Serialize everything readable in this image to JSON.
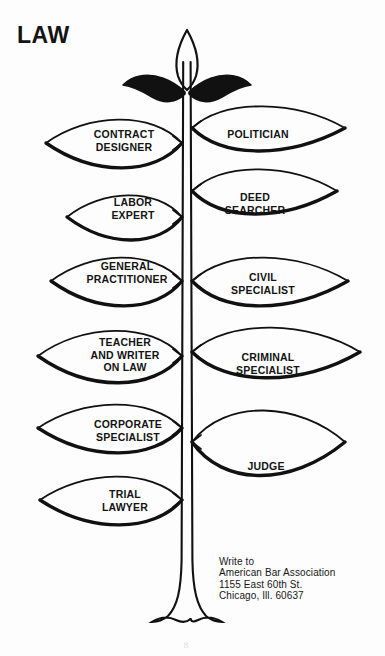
{
  "title": "LAW",
  "stem": {
    "icon": "plant-stem",
    "sprout_icon": "sprout-top-icon"
  },
  "leaves": [
    {
      "id": "contract-designer",
      "label": "CONTRACT\nDESIGNER",
      "side": "left",
      "attach_y": 143,
      "tip_x": 46,
      "text_x": 124,
      "text_y": 140,
      "half_h": 26,
      "bulge": 0.52
    },
    {
      "id": "politician",
      "label": "POLITICIAN",
      "side": "right",
      "attach_y": 128,
      "tip_x": 345,
      "text_x": 258,
      "text_y": 134,
      "half_h": 24,
      "bulge": 0.5
    },
    {
      "id": "deed-searcher",
      "label": "DEED\nSEARCHER",
      "side": "right",
      "attach_y": 191,
      "tip_x": 337,
      "text_x": 255,
      "text_y": 203,
      "half_h": 24,
      "bulge": 0.5
    },
    {
      "id": "labor-expert",
      "label": "LABOR\nEXPERT",
      "side": "left",
      "attach_y": 217,
      "tip_x": 67,
      "text_x": 133,
      "text_y": 208,
      "half_h": 24,
      "bulge": 0.52
    },
    {
      "id": "general-practitioner",
      "label": "GENERAL\nPRACTITIONER",
      "side": "left",
      "attach_y": 281,
      "tip_x": 51,
      "text_x": 127,
      "text_y": 272,
      "half_h": 26,
      "bulge": 0.52
    },
    {
      "id": "civil-specialist",
      "label": "CIVIL\nSPECIALIST",
      "side": "right",
      "attach_y": 281,
      "tip_x": 348,
      "text_x": 263,
      "text_y": 283,
      "half_h": 26,
      "bulge": 0.5
    },
    {
      "id": "teacher-and-writer-on-law",
      "label": "TEACHER\nAND WRITER\nON LAW",
      "side": "left",
      "attach_y": 356,
      "tip_x": 38,
      "text_x": 125,
      "text_y": 355,
      "half_h": 28,
      "bulge": 0.52
    },
    {
      "id": "criminal-specialist",
      "label": "CRIMINAL\nSPECIALIST",
      "side": "right",
      "attach_y": 352,
      "tip_x": 360,
      "text_x": 268,
      "text_y": 363,
      "half_h": 27,
      "bulge": 0.52
    },
    {
      "id": "corporate-specialist",
      "label": "CORPORATE\nSPECIALIST",
      "side": "left",
      "attach_y": 428,
      "tip_x": 38,
      "text_x": 128,
      "text_y": 430,
      "half_h": 26,
      "bulge": 0.52
    },
    {
      "id": "judge",
      "label": "JUDGE",
      "side": "right",
      "attach_y": 442,
      "tip_x": 345,
      "text_x": 266,
      "text_y": 466,
      "half_h": 35,
      "bulge": 0.52
    },
    {
      "id": "trial-lawyer",
      "label": "TRIAL\nLAWYER",
      "side": "left",
      "attach_y": 500,
      "tip_x": 40,
      "text_x": 125,
      "text_y": 500,
      "half_h": 26,
      "bulge": 0.52
    }
  ],
  "address": "Write to\nAmerican Bar Association\n1155 East 60th St.\nChicago, Ill. 60637",
  "page_number": "8",
  "colors": {
    "ink": "#111111",
    "background": "#fdfdfd"
  }
}
